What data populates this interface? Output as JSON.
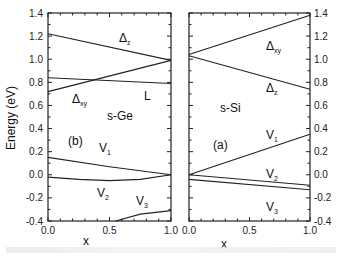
{
  "chart_data": [
    {
      "type": "line",
      "panel_label": "(b)",
      "material": "s-Ge",
      "xlabel": "x",
      "ylabel": "Energy (eV)",
      "xlim": [
        0.0,
        1.0
      ],
      "ylim": [
        -0.4,
        1.4
      ],
      "xticks": [
        "0.0",
        "0.5",
        "1.0"
      ],
      "yticks": [
        "-0.4",
        "-0.2",
        "0.0",
        "0.2",
        "0.4",
        "0.6",
        "0.8",
        "1.0",
        "1.2",
        "1.4"
      ],
      "series": [
        {
          "name": "Δz",
          "x": [
            0.0,
            1.0
          ],
          "y": [
            1.22,
            0.99
          ]
        },
        {
          "name": "Δxy",
          "x": [
            0.0,
            1.0
          ],
          "y": [
            0.72,
            0.99
          ]
        },
        {
          "name": "L",
          "x": [
            0.0,
            1.0
          ],
          "y": [
            0.84,
            0.79
          ]
        },
        {
          "name": "V1",
          "x": [
            0.0,
            0.5,
            1.0
          ],
          "y": [
            0.15,
            0.07,
            0.0
          ]
        },
        {
          "name": "V2",
          "x": [
            0.0,
            0.25,
            0.5,
            0.75,
            1.0
          ],
          "y": [
            -0.02,
            -0.04,
            -0.05,
            -0.04,
            0.0
          ]
        },
        {
          "name": "V3",
          "x": [
            0.55,
            0.75,
            1.0
          ],
          "y": [
            -0.4,
            -0.34,
            -0.31
          ]
        }
      ],
      "annotations": [
        "Δz",
        "Δxy",
        "L",
        "s-Ge",
        "(b)",
        "V1",
        "V2",
        "V3"
      ]
    },
    {
      "type": "line",
      "panel_label": "(a)",
      "material": "s-Si",
      "xlabel": "x",
      "ylabel": "",
      "xlim": [
        0.0,
        1.0
      ],
      "ylim": [
        -0.4,
        1.4
      ],
      "xticks": [
        "0.0",
        "0.5",
        "1.0"
      ],
      "yticks": [
        "-0.4",
        "-0.2",
        "0.0",
        "0.2",
        "0.4",
        "0.6",
        "0.8",
        "1.0",
        "1.2",
        "1.4"
      ],
      "yaxis_side": "right",
      "series": [
        {
          "name": "Δxy",
          "x": [
            0.0,
            1.0
          ],
          "y": [
            1.04,
            1.38
          ]
        },
        {
          "name": "Δz",
          "x": [
            0.0,
            1.0
          ],
          "y": [
            1.03,
            0.74
          ]
        },
        {
          "name": "V1",
          "x": [
            0.0,
            1.0
          ],
          "y": [
            0.0,
            0.35
          ]
        },
        {
          "name": "V2",
          "x": [
            0.0,
            1.0
          ],
          "y": [
            0.0,
            -0.09
          ]
        },
        {
          "name": "V3",
          "x": [
            0.0,
            1.0
          ],
          "y": [
            -0.04,
            -0.13
          ]
        }
      ],
      "annotations": [
        "Δxy",
        "Δz",
        "s-Si",
        "(a)",
        "V1",
        "V2",
        "V3"
      ]
    }
  ],
  "labels": {
    "ylabel": "Energy (eV)",
    "xlabel": "x",
    "left": {
      "panel": "(b)",
      "material": "s-Ge",
      "dz": "Δ",
      "dz_sub": "z",
      "dxy": "Δ",
      "dxy_sub": "xy",
      "L": "L",
      "v1": "V",
      "v1_sub": "1",
      "v2": "V",
      "v2_sub": "2",
      "v3": "V",
      "v3_sub": "3"
    },
    "right": {
      "panel": "(a)",
      "material": "s-Si",
      "dxy": "Δ",
      "dxy_sub": "xy",
      "dz": "Δ",
      "dz_sub": "z",
      "v1": "V",
      "v1_sub": "1",
      "v2": "V",
      "v2_sub": "2",
      "v3": "V",
      "v3_sub": "3"
    },
    "yticks": [
      "-0.4",
      "-0.2",
      "0.0",
      "0.2",
      "0.4",
      "0.6",
      "0.8",
      "1.0",
      "1.2",
      "1.4"
    ],
    "xticks_left": [
      "0.0",
      "0.5",
      "1.0"
    ],
    "xticks_right": [
      "0.0",
      "0.5",
      "1.0"
    ]
  }
}
